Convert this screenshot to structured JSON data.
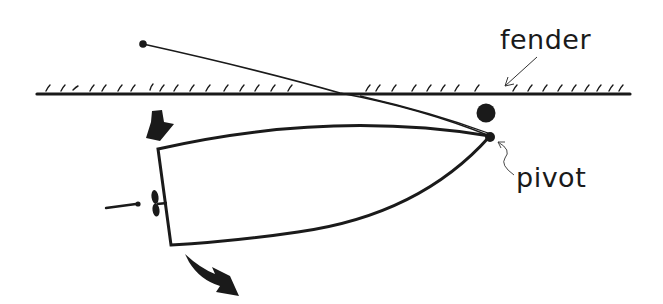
{
  "diagram": {
    "labels": {
      "fender": "fender",
      "pivot": "pivot"
    },
    "elements": {
      "dock": "dock-edge-with-hatching",
      "fender": "fender-ball",
      "boat": "boat-hull-outline",
      "spring_line": "spring-line-rope",
      "pivot_point": "bow-pivot-point",
      "propeller": "propeller",
      "thrust_arrow": "prop-wash-arrow",
      "force_arrow_in": "stern-force-arrow-down",
      "force_arrow_out": "stern-swing-arrow-out"
    },
    "colors": {
      "ink": "#1a1a1a",
      "background": "#ffffff"
    }
  }
}
